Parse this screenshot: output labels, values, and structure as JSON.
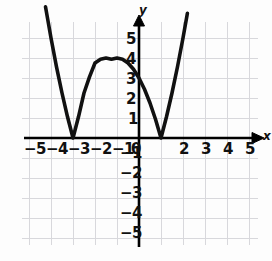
{
  "figure": {
    "background_color": "#fdfdfd",
    "curve_color": "#111111",
    "axis_color": "#000000",
    "grid_color": "#d8d8dc"
  },
  "axis_names": {
    "x": "x",
    "y": "y"
  },
  "chart_data": {
    "type": "line",
    "title": "",
    "xlabel": "x",
    "ylabel": "y",
    "grid": true,
    "legend": null,
    "xlim": [
      -5.8,
      5.8
    ],
    "ylim": [
      -5.6,
      6.0
    ],
    "xticks": [
      -5,
      -4,
      -3,
      -2,
      -1,
      0,
      1,
      2,
      3,
      4,
      5
    ],
    "yticks": [
      -5,
      -4,
      -3,
      -2,
      -1,
      1,
      2,
      3,
      4,
      5
    ],
    "xtick_labels": [
      "-5",
      "-4",
      "-3",
      "-2",
      "-1",
      "0",
      "1",
      "2",
      "3",
      "4",
      "5"
    ],
    "ytick_labels": [
      "-5",
      "-4",
      "-3",
      "-2",
      "-1",
      "1",
      "2",
      "3",
      "4",
      "5"
    ],
    "x_axis_label_positions": [
      -5,
      -4,
      -3,
      -2,
      -1,
      0,
      2,
      3,
      4,
      5
    ],
    "x_axis_label_texts": [
      "-5",
      "-4",
      "-3",
      "-2",
      "-1",
      "0",
      "2",
      "3",
      "4",
      "5"
    ],
    "hidden_xtick_label": "1",
    "annotations": [
      {
        "text": "x-intercept",
        "x": -3,
        "y": 0
      },
      {
        "text": "x-intercept",
        "x": 1,
        "y": 0
      },
      {
        "text": "local maximum",
        "x": -1,
        "y": 4
      },
      {
        "text": "y-intercept",
        "x": 0,
        "y": 3
      }
    ],
    "series": [
      {
        "name": "curve",
        "comment": "y = |(x+3)(x-1)| : V-cusps at x=-3 and x=1, peak 4 at x=-1",
        "x": [
          -4.25,
          -4.0,
          -3.75,
          -3.5,
          -3.25,
          -3.0,
          -2.75,
          -2.5,
          -2.25,
          -2.0,
          -1.75,
          -1.5,
          -1.25,
          -1.0,
          -0.75,
          -0.5,
          -0.25,
          0.0,
          0.25,
          0.5,
          0.75,
          1.0,
          1.25,
          1.5,
          1.75,
          2.0,
          2.2
        ],
        "y": [
          6.56,
          5.0,
          3.56,
          2.25,
          1.06,
          0.0,
          1.06,
          2.25,
          3.06,
          3.75,
          3.9375,
          4.0,
          3.9375,
          4.0,
          3.9375,
          3.75,
          3.4375,
          3.0,
          2.4375,
          1.75,
          0.9375,
          0.0,
          1.0625,
          2.25,
          3.5625,
          5.0,
          6.24
        ]
      }
    ]
  },
  "x_labels": [
    {
      "t": "−5",
      "x": 30,
      "y": 142
    },
    {
      "t": "−4",
      "x": 52,
      "y": 142
    },
    {
      "t": "−3",
      "x": 74,
      "y": 142
    },
    {
      "t": "−2",
      "x": 96,
      "y": 142
    },
    {
      "t": "−1",
      "x": 118,
      "y": 142
    },
    {
      "t": "0",
      "x": 143,
      "y": 142
    },
    {
      "t": "2",
      "x": 182,
      "y": 142
    },
    {
      "t": "3",
      "x": 204,
      "y": 142
    },
    {
      "t": "4",
      "x": 226,
      "y": 142
    },
    {
      "t": "5",
      "x": 248,
      "y": 142
    }
  ],
  "y_labels": [
    {
      "t": "5",
      "x": 126,
      "y": 40
    },
    {
      "t": "4",
      "x": 126,
      "y": 60
    },
    {
      "t": "3",
      "x": 126,
      "y": 80
    },
    {
      "t": "2",
      "x": 126,
      "y": 100
    },
    {
      "t": "1",
      "x": 126,
      "y": 120
    },
    {
      "t": "−1",
      "x": 120,
      "y": 152
    },
    {
      "t": "−2",
      "x": 120,
      "y": 172
    },
    {
      "t": "−3",
      "x": 120,
      "y": 192
    },
    {
      "t": "−4",
      "x": 120,
      "y": 212
    },
    {
      "t": "−5",
      "x": 120,
      "y": 232
    }
  ],
  "axis_name_labels": [
    {
      "t": "y",
      "x": 139,
      "y": 8,
      "name": "y-axis-name"
    },
    {
      "t": "x",
      "x": 261,
      "y": 132,
      "name": "x-axis-name"
    }
  ]
}
